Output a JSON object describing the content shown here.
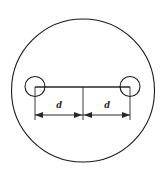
{
  "figure": {
    "type": "engineering-diagram",
    "canvas": {
      "width": 167,
      "height": 180,
      "background": "#ffffff"
    },
    "colors": {
      "outline": "#1a1a1a",
      "dimension": "#262626",
      "label": "#1a1a1a",
      "background": "#ffffff"
    },
    "outer_circle": {
      "name": "outer-plate-circle",
      "cx": 83,
      "cy": 90.5,
      "r": 71.5,
      "stroke_width": 1.1
    },
    "holes": [
      {
        "name": "left-hole",
        "cx": 35,
        "cy": 86.5,
        "r": 10,
        "stroke_width": 1.1
      },
      {
        "name": "right-hole",
        "cx": 130,
        "cy": 86.5,
        "r": 10,
        "stroke_width": 1.1
      }
    ],
    "center_line": {
      "name": "hole-center-connector",
      "x1": 35,
      "y1": 87,
      "x2": 130,
      "y2": 87,
      "stroke_width": 1.6
    },
    "extension_lines": [
      {
        "name": "extension-line-left",
        "x": 35,
        "y1": 87,
        "y2": 120
      },
      {
        "name": "extension-line-center",
        "x": 83,
        "y1": 87,
        "y2": 120
      },
      {
        "name": "extension-line-right",
        "x": 130,
        "y1": 87,
        "y2": 120
      }
    ],
    "dimension_line": {
      "name": "dimension-baseline",
      "y": 115,
      "x_start": 35,
      "x_mid": 83,
      "x_end": 130,
      "stroke_width": 1.0
    },
    "dimensions": [
      {
        "name": "dimension-left",
        "label": "d",
        "label_x": 59,
        "label_y": 108,
        "from_x": 35,
        "to_x": 83
      },
      {
        "name": "dimension-right",
        "label": "d",
        "label_x": 107,
        "label_y": 108,
        "from_x": 83,
        "to_x": 130
      }
    ],
    "arrowheads": [
      {
        "name": "arrowhead-left-outer",
        "x": 35,
        "y": 115,
        "direction": "left"
      },
      {
        "name": "arrowhead-center-left",
        "x": 83,
        "y": 115,
        "direction": "right"
      },
      {
        "name": "arrowhead-center-right",
        "x": 83,
        "y": 115,
        "direction": "left"
      },
      {
        "name": "arrowhead-right-outer",
        "x": 130,
        "y": 115,
        "direction": "right"
      }
    ]
  }
}
